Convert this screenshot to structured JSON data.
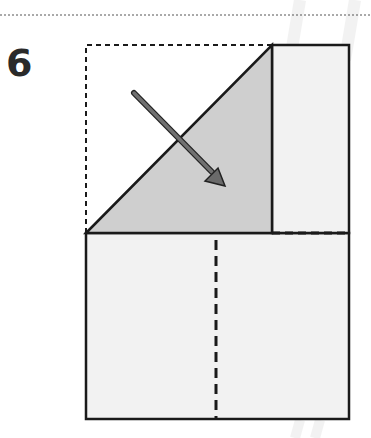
{
  "diagram": {
    "type": "origami-fold-step",
    "step_number": "6",
    "colors": {
      "line": "#1a1a1a",
      "paper_front": "#f2f2f2",
      "paper_folded": "#cfcfcf",
      "arrow": "#666666",
      "watermark": "#e6e6e6"
    },
    "elements": [
      "dotted separator line at top",
      "dashed outline of original square position",
      "shaded triangular flap being folded",
      "diagonal arrow indicating fold direction",
      "right narrow rectangle panel",
      "horizontal dashed fold line",
      "vertical dashed fold line on bottom square"
    ]
  }
}
